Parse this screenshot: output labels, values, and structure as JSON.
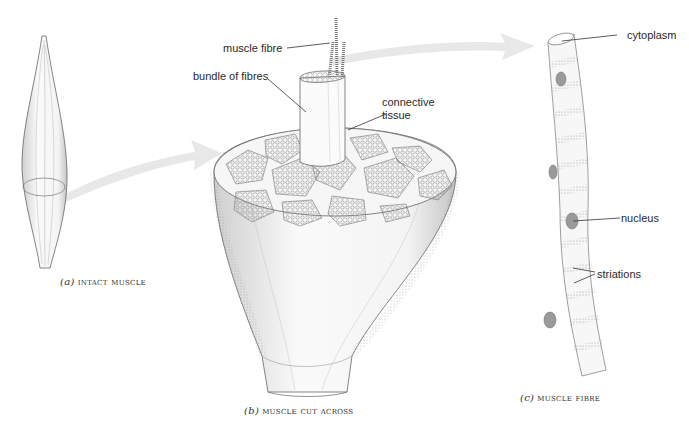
{
  "figure": {
    "panels": [
      {
        "id": "a",
        "letter": "(a)",
        "caption": "INTACT MUSCLE"
      },
      {
        "id": "b",
        "letter": "(b)",
        "caption": "MUSCLE CUT ACROSS"
      },
      {
        "id": "c",
        "letter": "(c)",
        "caption": "MUSCLE FIBRE"
      }
    ],
    "labels": {
      "muscle_fibre": "muscle fibre",
      "bundle_of_fibres": "bundle of fibres",
      "connective_tissue_1": "connective",
      "connective_tissue_2": "tissue",
      "cytoplasm": "cytoplasm",
      "nucleus": "nucleus",
      "striations": "striations"
    },
    "colors": {
      "line": "#555555",
      "stipple": "#9a9a9a",
      "arrow": "#d9d9d9",
      "text": "#2a2a2a"
    }
  }
}
